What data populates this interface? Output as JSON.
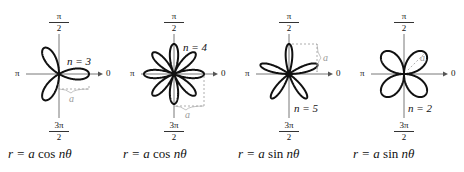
{
  "figure": {
    "axis_labels": {
      "top_num": "π",
      "top_den": "2",
      "bottom_num": "3π",
      "bottom_den": "2",
      "left": "π",
      "right": "0"
    },
    "colors": {
      "curve": "#111111",
      "axis": "#555555",
      "annotation": "#9a9a9a"
    },
    "panels": [
      {
        "n_label": "n = 3",
        "equation_lhs": "r = a",
        "equation_fn": "cos",
        "equation_rhs": "nθ",
        "a_label": "a",
        "n": 3,
        "fn": "cos"
      },
      {
        "n_label": "n = 4",
        "equation_lhs": "r = a",
        "equation_fn": "cos",
        "equation_rhs": "nθ",
        "a_label": "a",
        "n": 4,
        "fn": "cos"
      },
      {
        "n_label": "n = 5",
        "equation_lhs": "r = a",
        "equation_fn": "sin",
        "equation_rhs": "nθ",
        "a_label": "a",
        "n": 5,
        "fn": "sin"
      },
      {
        "n_label": "n = 2",
        "equation_lhs": "r = a",
        "equation_fn": "sin",
        "equation_rhs": "nθ",
        "a_label": "a",
        "n": 2,
        "fn": "sin"
      }
    ]
  }
}
